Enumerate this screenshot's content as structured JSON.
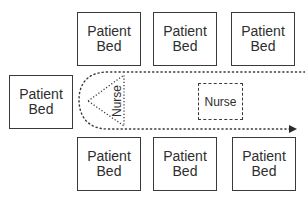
{
  "diagram": {
    "type": "ward-layout",
    "beds": [
      {
        "id": "bed-top-1",
        "label": "Patient\nBed"
      },
      {
        "id": "bed-top-2",
        "label": "Patient\nBed"
      },
      {
        "id": "bed-top-3",
        "label": "Patient\nBed"
      },
      {
        "id": "bed-left",
        "label": "Patient\nBed"
      },
      {
        "id": "bed-bottom-1",
        "label": "Patient\nBed"
      },
      {
        "id": "bed-bottom-2",
        "label": "Patient\nBed"
      },
      {
        "id": "bed-bottom-3",
        "label": "Patient\nBed"
      }
    ],
    "nurse_triangle": {
      "label": "Nurse"
    },
    "nurse_box": {
      "label": "Nurse"
    },
    "path": {
      "style": "dotted",
      "direction": "U-turn, arrow pointing right"
    },
    "colors": {
      "stroke": "#3a3a3a",
      "text": "#2e2e2e",
      "background": "#ffffff"
    }
  }
}
